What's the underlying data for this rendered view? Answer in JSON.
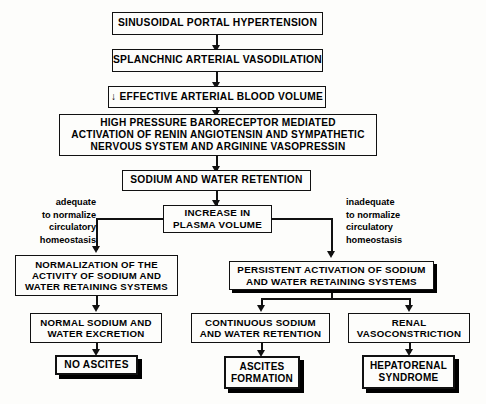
{
  "diagram": {
    "nodes": {
      "n1": {
        "label": "SINUSOIDAL PORTAL HYPERTENSION"
      },
      "n2": {
        "label": "SPLANCHNIC ARTERIAL VASODILATION"
      },
      "n3": {
        "label": "↓ EFFECTIVE ARTERIAL BLOOD VOLUME"
      },
      "n4": {
        "label": "HIGH PRESSURE BARORECEPTOR MEDIATED\nACTIVATION OF RENIN ANGIOTENSIN AND SYMPATHETIC\nNERVOUS SYSTEM AND ARGININE VASOPRESSIN"
      },
      "n5": {
        "label": "SODIUM AND WATER RETENTION"
      },
      "n6": {
        "label": "INCREASE IN\nPLASMA VOLUME"
      },
      "n7": {
        "label": "NORMALIZATION OF THE\nACTIVITY OF SODIUM AND\nWATER RETAINING SYSTEMS"
      },
      "n8": {
        "label": "PERSISTENT ACTIVATION OF SODIUM\nAND WATER RETAINING SYSTEMS"
      },
      "n9": {
        "label": "NORMAL SODIUM AND\nWATER EXCRETION"
      },
      "n10": {
        "label": "CONTINUOUS SODIUM\nAND WATER RETENTION"
      },
      "n11": {
        "label": "RENAL\nVASOCONSTRICTION"
      },
      "n12": {
        "label": "NO ASCITES"
      },
      "n13": {
        "label": "ASCITES\nFORMATION"
      },
      "n14": {
        "label": "HEPATORENAL\nSYNDROME"
      }
    },
    "edge_labels": {
      "left": "adequate\nto normalize\ncirculatory\nhomeostasis",
      "right": "inadequate\nto normalize\ncirculatory\nhomeostasis"
    },
    "colors": {
      "line": "#111111",
      "box_fill": "#fdfdfb",
      "text": "#000000",
      "background": "#fdfdfb"
    }
  }
}
